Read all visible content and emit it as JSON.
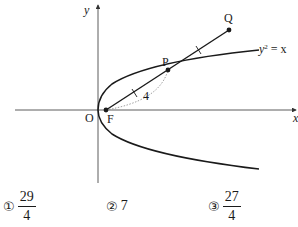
{
  "diagram": {
    "axes": {
      "x_label": "x",
      "y_label": "y",
      "origin_label": "O"
    },
    "curve_label": "y² = x",
    "curve_label_base": "y",
    "curve_label_sup": "2",
    "curve_label_rest": " = x",
    "points": {
      "focus": "F",
      "p": "P",
      "q": "Q"
    },
    "distance_label": "4",
    "colors": {
      "line": "#1a1a1a",
      "axis": "#333333",
      "dotted": "#888888"
    }
  },
  "choices": [
    {
      "marker": "①",
      "numerator": "29",
      "denominator": "4"
    },
    {
      "marker": "②",
      "value": "7"
    },
    {
      "marker": "③",
      "numerator": "27",
      "denominator": "4"
    }
  ]
}
